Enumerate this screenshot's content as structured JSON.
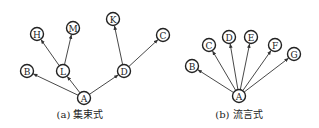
{
  "diagrams": [
    {
      "id": "a",
      "caption": "(a) 集束式",
      "caption_pos": [
        80,
        118
      ],
      "node_radius": 6.5,
      "nodes": [
        {
          "id": "A",
          "label": "A",
          "x": 84,
          "y": 98
        },
        {
          "id": "B",
          "label": "B",
          "x": 27,
          "y": 71
        },
        {
          "id": "L",
          "label": "L",
          "x": 63,
          "y": 71
        },
        {
          "id": "D",
          "label": "D",
          "x": 124,
          "y": 71
        },
        {
          "id": "H",
          "label": "H",
          "x": 37,
          "y": 34
        },
        {
          "id": "M",
          "label": "M",
          "x": 73,
          "y": 28
        },
        {
          "id": "K",
          "label": "K",
          "x": 113,
          "y": 19
        },
        {
          "id": "C",
          "label": "C",
          "x": 163,
          "y": 35
        }
      ],
      "edges": [
        {
          "from": "A",
          "to": "B"
        },
        {
          "from": "A",
          "to": "L"
        },
        {
          "from": "A",
          "to": "D"
        },
        {
          "from": "L",
          "to": "H"
        },
        {
          "from": "L",
          "to": "M"
        },
        {
          "from": "D",
          "to": "K"
        },
        {
          "from": "D",
          "to": "C"
        }
      ]
    },
    {
      "id": "b",
      "caption": "(b) 流言式",
      "caption_pos": [
        239,
        118
      ],
      "node_radius": 6.5,
      "nodes": [
        {
          "id": "A",
          "label": "A",
          "x": 239,
          "y": 96
        },
        {
          "id": "B",
          "label": "B",
          "x": 192,
          "y": 66
        },
        {
          "id": "C",
          "label": "C",
          "x": 209,
          "y": 45
        },
        {
          "id": "D",
          "label": "D",
          "x": 229,
          "y": 37
        },
        {
          "id": "E",
          "label": "E",
          "x": 251,
          "y": 37
        },
        {
          "id": "F",
          "label": "F",
          "x": 275,
          "y": 45
        },
        {
          "id": "G",
          "label": "G",
          "x": 294,
          "y": 54
        }
      ],
      "edges": [
        {
          "from": "A",
          "to": "B"
        },
        {
          "from": "A",
          "to": "C"
        },
        {
          "from": "A",
          "to": "D"
        },
        {
          "from": "A",
          "to": "E"
        },
        {
          "from": "A",
          "to": "F"
        },
        {
          "from": "A",
          "to": "G"
        }
      ]
    }
  ]
}
